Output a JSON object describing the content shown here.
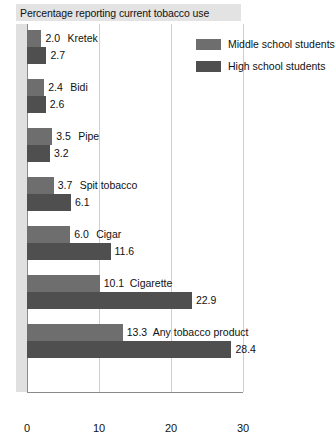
{
  "chart_data": {
    "type": "bar",
    "orientation": "horizontal",
    "title": "Percentage reporting current tobacco use",
    "xlabel": "",
    "ylabel": "",
    "xlim": [
      0,
      30
    ],
    "xticks": [
      "0",
      "10",
      "20",
      "30"
    ],
    "xtick_values": [
      0,
      10,
      20,
      30
    ],
    "grid": true,
    "legend_position": "top-right",
    "categories": [
      "Kretek",
      "Bidi",
      "Pipe",
      "Spit tobacco",
      "Cigar",
      "Cigarette",
      "Any tobacco product"
    ],
    "series": [
      {
        "name": "Middle school students",
        "color": "#6e6e6e",
        "values": [
          2.0,
          2.4,
          3.5,
          3.7,
          6.0,
          10.1,
          13.3
        ],
        "labels": [
          "2.0",
          "2.4",
          "3.5",
          "3.7",
          "6.0",
          "10.1",
          "13.3"
        ]
      },
      {
        "name": "High school students",
        "color": "#4f4f4f",
        "values": [
          2.7,
          2.6,
          3.2,
          6.1,
          11.6,
          22.9,
          28.4
        ],
        "labels": [
          "2.7",
          "2.6",
          "3.2",
          "6.1",
          "11.6",
          "22.9",
          "28.4"
        ]
      }
    ]
  },
  "legend": {
    "items": [
      {
        "label": "Middle school students",
        "color": "#6e6e6e"
      },
      {
        "label": "High school students",
        "color": "#4f4f4f"
      }
    ]
  },
  "colors": {
    "middle_school": "#6e6e6e",
    "high_school": "#4f4f4f",
    "title_band": "#e3e3e3",
    "gridline": "#cfcfcf",
    "axis": "#8a8a8a"
  }
}
